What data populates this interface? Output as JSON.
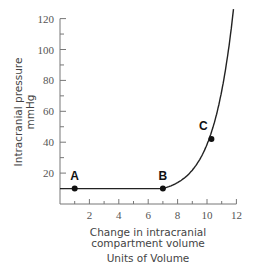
{
  "chart_data": {
    "type": "line",
    "title": "",
    "xlabel": "Change in intracranial compartment volume",
    "xlabel_lines": [
      "Change in intracranial",
      "compartment volume"
    ],
    "units_label": "Units of Volume",
    "ylabel": "Intracranial pressure mmHg",
    "ylabel_lines": [
      "Intracranial pressure",
      "mmHg"
    ],
    "xlim": [
      0,
      12
    ],
    "ylim": [
      0,
      120
    ],
    "x_ticks": [
      2,
      4,
      6,
      8,
      10,
      12
    ],
    "y_ticks": [
      20,
      40,
      60,
      80,
      100,
      120
    ],
    "grid": false,
    "series": [
      {
        "name": "Volume-pressure curve",
        "x": [
          0,
          1,
          7,
          8,
          9,
          10,
          10.3,
          11,
          11.5,
          12
        ],
        "y": [
          10,
          10,
          10,
          14,
          22,
          36,
          42,
          62,
          85,
          118
        ]
      }
    ],
    "annotations": [
      {
        "label": "A",
        "x": 1,
        "y": 10
      },
      {
        "label": "B",
        "x": 7,
        "y": 10
      },
      {
        "label": "C",
        "x": 10.3,
        "y": 42
      }
    ]
  }
}
